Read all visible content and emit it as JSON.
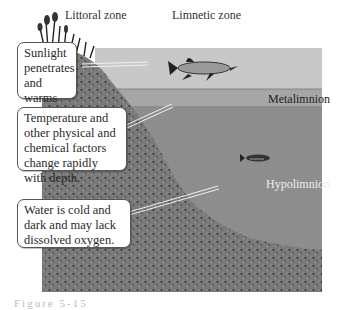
{
  "zones": {
    "littoral": "Littoral zone",
    "limnetic": "Limnetic zone"
  },
  "layers": {
    "metalimnion": "Metalimnion",
    "hypolimnion": "Hypolimnion"
  },
  "callouts": [
    {
      "text": "Sunlight penetrates and warms the water."
    },
    {
      "text": "Temperature and other physical and chemical factors change rapidly with depth."
    },
    {
      "text": "Water is cold and dark and may lack dissolved oxygen."
    }
  ],
  "caption": "Figure 5-15",
  "colors": {
    "epilimnion": "#c9c9c9",
    "metalimnion": "#a9a9a9",
    "hypolimnion": "#8a8a8a",
    "sediment": "#6e6e6e",
    "callout_border": "#555555"
  }
}
